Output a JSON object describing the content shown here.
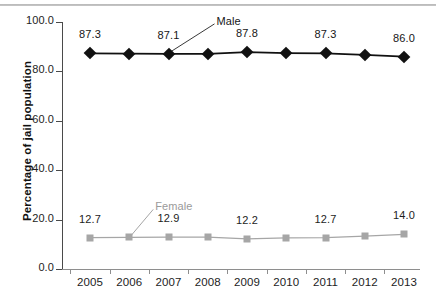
{
  "chart_data": {
    "type": "line",
    "title": "",
    "xlabel": "",
    "ylabel": "Percentage of jail population",
    "categories": [
      "2005",
      "2006",
      "2007",
      "2008",
      "2009",
      "2010",
      "2011",
      "2012",
      "2013"
    ],
    "ylim": [
      0.0,
      100.0
    ],
    "yticks": [
      "0.0",
      "20.0",
      "40.0",
      "60.0",
      "80.0",
      "100.0"
    ],
    "ytick_values": [
      0.0,
      20.0,
      40.0,
      60.0,
      80.0,
      100.0
    ],
    "grid": false,
    "legend": "annotations",
    "series": [
      {
        "name": "Male",
        "color": "#111111",
        "marker": "diamond",
        "values": [
          87.3,
          87.2,
          87.1,
          87.1,
          87.8,
          87.4,
          87.3,
          86.7,
          86.0
        ],
        "labels": [
          "87.3",
          "",
          "87.1",
          "",
          "87.8",
          "",
          "87.3",
          "",
          "86.0"
        ],
        "annotation": "Male",
        "annotation_target": "2007"
      },
      {
        "name": "Female",
        "color": "#a6a6a6",
        "marker": "square",
        "values": [
          12.7,
          12.8,
          12.9,
          12.9,
          12.2,
          12.6,
          12.7,
          13.3,
          14.0
        ],
        "labels": [
          "12.7",
          "",
          "12.9",
          "",
          "12.2",
          "",
          "12.7",
          "",
          "14.0"
        ],
        "annotation": "Female",
        "annotation_target": "2006"
      }
    ]
  }
}
